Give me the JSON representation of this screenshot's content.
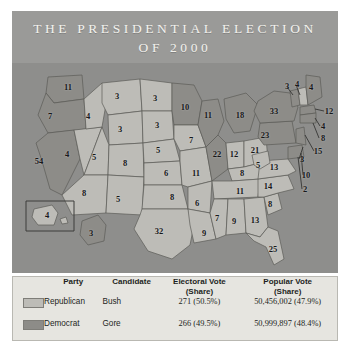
{
  "title": {
    "line1": "THE PRESIDENTIAL ELECTION",
    "line2": "OF 2000"
  },
  "colors": {
    "banner": "#9a9a98",
    "ocean": "#8e8e8c",
    "republican_fill": "#bdbcb7",
    "democrat_fill": "#8d8c88",
    "panel_bg": "#e6e5e0",
    "state_border": "#5c5b58",
    "title_text": "#f3f2ee"
  },
  "legend": {
    "headers": {
      "party": "Party",
      "candidate": "Candidate",
      "electoral_vote": "Electoral Vote",
      "electoral_vote_sub": "(Share)",
      "popular_vote": "Popular Vote",
      "popular_vote_sub": "(Share)"
    },
    "rows": [
      {
        "party": "Republican",
        "candidate": "Bush",
        "electoral_vote": "271 (50.5%)",
        "popular_vote": "50,456,002 (47.9%)",
        "swatch": "republican-swatch"
      },
      {
        "party": "Democrat",
        "candidate": "Gore",
        "electoral_vote": "266 (49.5%)",
        "popular_vote": "50,999,897 (48.4%)",
        "swatch": "democrat-swatch"
      }
    ]
  },
  "map": {
    "states": [
      {
        "code": "WA",
        "votes": "11",
        "x": 56,
        "y": 24,
        "party": "democrat"
      },
      {
        "code": "OR",
        "votes": "7",
        "x": 38,
        "y": 53,
        "party": "democrat"
      },
      {
        "code": "CA",
        "votes": "54",
        "x": 27,
        "y": 98,
        "party": "democrat"
      },
      {
        "code": "NV",
        "votes": "4",
        "x": 55,
        "y": 91,
        "party": "republican"
      },
      {
        "code": "ID",
        "votes": "4",
        "x": 76,
        "y": 53,
        "party": "republican"
      },
      {
        "code": "MT",
        "votes": "3",
        "x": 105,
        "y": 33,
        "party": "republican"
      },
      {
        "code": "WY",
        "votes": "3",
        "x": 108,
        "y": 66,
        "party": "republican"
      },
      {
        "code": "UT",
        "votes": "5",
        "x": 82,
        "y": 94,
        "party": "republican"
      },
      {
        "code": "AZ",
        "votes": "8",
        "x": 72,
        "y": 130,
        "party": "republican"
      },
      {
        "code": "CO",
        "votes": "8",
        "x": 113,
        "y": 100,
        "party": "republican"
      },
      {
        "code": "NM",
        "votes": "5",
        "x": 106,
        "y": 136,
        "party": "republican"
      },
      {
        "code": "ND",
        "votes": "3",
        "x": 143,
        "y": 35,
        "party": "republican"
      },
      {
        "code": "SD",
        "votes": "3",
        "x": 145,
        "y": 62,
        "party": "republican"
      },
      {
        "code": "NE",
        "votes": "5",
        "x": 146,
        "y": 87,
        "party": "republican"
      },
      {
        "code": "KS",
        "votes": "6",
        "x": 154,
        "y": 110,
        "party": "republican"
      },
      {
        "code": "OK",
        "votes": "8",
        "x": 160,
        "y": 134,
        "party": "republican"
      },
      {
        "code": "TX",
        "votes": "32",
        "x": 147,
        "y": 168,
        "party": "republican"
      },
      {
        "code": "MN",
        "votes": "10",
        "x": 173,
        "y": 44,
        "party": "democrat"
      },
      {
        "code": "IA",
        "votes": "7",
        "x": 179,
        "y": 77,
        "party": "republican"
      },
      {
        "code": "MO",
        "votes": "11",
        "x": 184,
        "y": 110,
        "party": "republican"
      },
      {
        "code": "AR",
        "votes": "6",
        "x": 185,
        "y": 140,
        "party": "republican"
      },
      {
        "code": "LA",
        "votes": "9",
        "x": 192,
        "y": 170,
        "party": "republican"
      },
      {
        "code": "WI",
        "votes": "11",
        "x": 196,
        "y": 52,
        "party": "democrat"
      },
      {
        "code": "IL",
        "votes": "22",
        "x": 205,
        "y": 91,
        "party": "democrat"
      },
      {
        "code": "MI",
        "votes": "18",
        "x": 228,
        "y": 52,
        "party": "democrat"
      },
      {
        "code": "IN",
        "votes": "12",
        "x": 222,
        "y": 91,
        "party": "republican"
      },
      {
        "code": "OH",
        "votes": "21",
        "x": 243,
        "y": 87,
        "party": "republican"
      },
      {
        "code": "KY",
        "votes": "8",
        "x": 230,
        "y": 110,
        "party": "republican"
      },
      {
        "code": "TN",
        "votes": "11",
        "x": 228,
        "y": 128,
        "party": "republican"
      },
      {
        "code": "MS",
        "votes": "7",
        "x": 205,
        "y": 155,
        "party": "republican"
      },
      {
        "code": "AL",
        "votes": "9",
        "x": 222,
        "y": 158,
        "party": "republican"
      },
      {
        "code": "GA",
        "votes": "13",
        "x": 243,
        "y": 157,
        "party": "republican"
      },
      {
        "code": "FL",
        "votes": "25",
        "x": 261,
        "y": 186,
        "party": "republican"
      },
      {
        "code": "SC",
        "votes": "8",
        "x": 258,
        "y": 141,
        "party": "republican"
      },
      {
        "code": "NC",
        "votes": "14",
        "x": 256,
        "y": 123,
        "party": "republican"
      },
      {
        "code": "VA",
        "votes": "13",
        "x": 262,
        "y": 104,
        "party": "republican"
      },
      {
        "code": "WV",
        "votes": "5",
        "x": 246,
        "y": 102,
        "party": "republican"
      },
      {
        "code": "PA",
        "votes": "23",
        "x": 253,
        "y": 72,
        "party": "democrat"
      },
      {
        "code": "NY",
        "votes": "33",
        "x": 262,
        "y": 48,
        "party": "democrat"
      },
      {
        "code": "VT",
        "votes": "3",
        "x": 275,
        "y": 23,
        "party": "democrat"
      },
      {
        "code": "NH",
        "votes": "4",
        "x": 285,
        "y": 21,
        "party": "republican"
      },
      {
        "code": "ME",
        "votes": "4",
        "x": 299,
        "y": 24,
        "party": "democrat"
      },
      {
        "code": "MA",
        "votes": "12",
        "x": 317,
        "y": 48,
        "party": "democrat"
      },
      {
        "code": "RI",
        "votes": "4",
        "x": 311,
        "y": 63,
        "party": "democrat"
      },
      {
        "code": "CT",
        "votes": "8",
        "x": 311,
        "y": 75,
        "party": "democrat"
      },
      {
        "code": "NJ",
        "votes": "15",
        "x": 306,
        "y": 88,
        "party": "democrat"
      },
      {
        "code": "DE",
        "votes": "3",
        "x": 290,
        "y": 96,
        "party": "democrat"
      },
      {
        "code": "MD",
        "votes": "10",
        "x": 294,
        "y": 112,
        "party": "democrat"
      },
      {
        "code": "DC",
        "votes": "2",
        "x": 293,
        "y": 126,
        "party": "democrat"
      },
      {
        "code": "AK",
        "votes": "4",
        "x": 35,
        "y": 152,
        "party": "republican"
      },
      {
        "code": "HI",
        "votes": "3",
        "x": 79,
        "y": 170,
        "party": "democrat"
      }
    ]
  }
}
